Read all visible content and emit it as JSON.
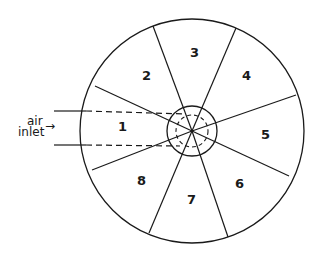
{
  "diagram": {
    "title": "",
    "segments": [
      {
        "id": 1,
        "label": "1"
      },
      {
        "id": 2,
        "label": "2"
      },
      {
        "id": 3,
        "label": "3"
      },
      {
        "id": 4,
        "label": "4"
      },
      {
        "id": 5,
        "label": "5"
      },
      {
        "id": 6,
        "label": "6"
      },
      {
        "id": 7,
        "label": "7"
      },
      {
        "id": 8,
        "label": "8"
      }
    ],
    "inlet": {
      "line1": "air",
      "line2": "inlet",
      "arrow": "→"
    },
    "colors": {
      "stroke": "#1a1a1a",
      "background": "#ffffff"
    }
  }
}
